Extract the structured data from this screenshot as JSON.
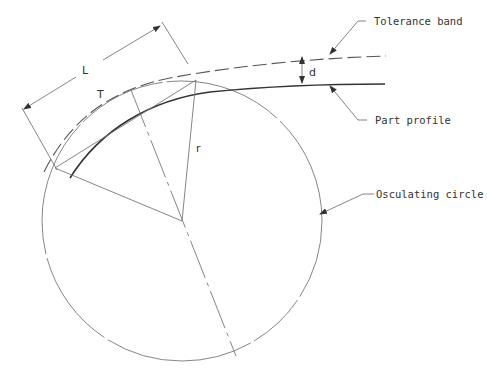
{
  "diagram": {
    "labels": {
      "tolerance_band": "Tolerance band",
      "part_profile": "Part profile",
      "osculating_circle": "Osculating circle",
      "length_symbol": "L",
      "deviation_symbol": "d",
      "radius_symbol": "r",
      "tangent_symbol": "T"
    },
    "colors": {
      "line": "#333333",
      "thin_line": "#777777",
      "background": "#ffffff"
    }
  }
}
